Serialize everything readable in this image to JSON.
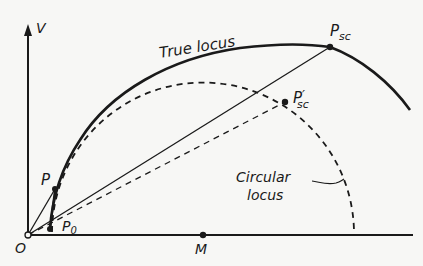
{
  "diagram": {
    "axis_labels": {
      "vertical": "V",
      "origin": "O"
    },
    "points": {
      "M": "M",
      "P": "P",
      "P0_main": "P",
      "P0_sub": "0",
      "Psc_main": "P",
      "Psc_sub": "sc",
      "Psc_prime_main": "P",
      "Psc_prime_sub": "sc",
      "Psc_prime_mark": "′"
    },
    "annotations": {
      "true_locus": "True locus",
      "circular_locus_line1": "Circular",
      "circular_locus_line2": "locus"
    },
    "colors": {
      "ink": "#1a1a1a",
      "paper": "#f7f7f5"
    }
  }
}
